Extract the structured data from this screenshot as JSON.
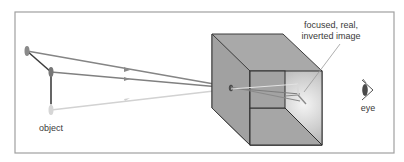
{
  "diagram": {
    "type": "pinhole-camera",
    "labels": {
      "object": "object",
      "image_line1": "focused, real,",
      "image_line2": "inverted image",
      "eye": "eye"
    },
    "colors": {
      "frame": "#9a9a9a",
      "box_face": "#a8a8a8",
      "box_edge": "#3c3c3c",
      "ray_dark": "#7d7d7d",
      "ray_light": "#cfcfcf",
      "object_stem": "#4a4a4a"
    }
  }
}
